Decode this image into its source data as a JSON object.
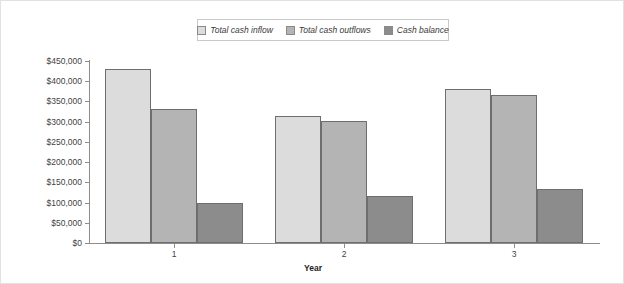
{
  "chart_data": {
    "type": "bar",
    "title": "",
    "subtitle": "",
    "xlabel": "Year",
    "ylabel": "",
    "categories": [
      "1",
      "2",
      "3"
    ],
    "series": [
      {
        "name": "Total cash inflow",
        "color": "#dcdcdc",
        "values": [
          430000,
          314000,
          380000
        ]
      },
      {
        "name": "Total cash outflows",
        "color": "#b4b4b4",
        "values": [
          331000,
          302000,
          366000
        ]
      },
      {
        "name": "Cash balance",
        "color": "#8c8c8c",
        "values": [
          100000,
          116000,
          133000
        ]
      }
    ],
    "ylim": [
      0,
      450000
    ],
    "ytick_values": [
      0,
      50000,
      100000,
      150000,
      200000,
      250000,
      300000,
      350000,
      400000,
      450000
    ],
    "ytick_labels": [
      "$0",
      "$50,000",
      "$100,000",
      "$150,000",
      "$200,000",
      "$250,000",
      "$300,000",
      "$350,000",
      "$400,000",
      "$450,000"
    ],
    "grid": false,
    "legend_position": "top-center",
    "legend_entries": [
      "Total cash inflow",
      "Total cash outflows",
      "Cash balance"
    ],
    "annotations": []
  },
  "axis_colors": {
    "axis_line": "#8d8d8d",
    "bar_outline": "#6e6e6e",
    "text": "#3f3f3f",
    "legend_border": "#c9c9c9",
    "figure_border": "#e2e2e2"
  }
}
